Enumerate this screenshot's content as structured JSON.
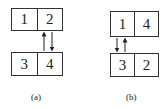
{
  "panels": [
    {
      "label": "(a)",
      "top_row": [
        "1",
        "2"
      ],
      "bottom_row": [
        "3",
        "4"
      ],
      "arrows": [
        {
          "direction": "up",
          "between": "4 to 2"
        },
        {
          "direction": "down",
          "between": "2 to 4"
        }
      ]
    },
    {
      "label": "(b)",
      "top_row": [
        "1",
        "4"
      ],
      "bottom_row": [
        "3",
        "2"
      ],
      "arrows": [
        {
          "direction": "down",
          "between": "1 to 3"
        },
        {
          "direction": "up",
          "between": "3 to 1"
        }
      ]
    }
  ]
}
